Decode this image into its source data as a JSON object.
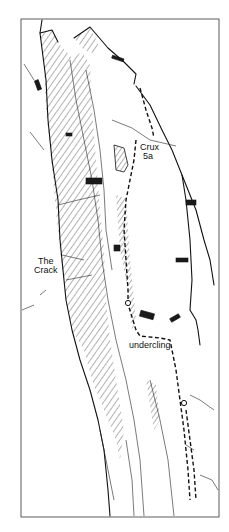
{
  "figure": {
    "type": "climbing-route-topo",
    "colors": {
      "ink": "#111111",
      "paper": "#ffffff"
    },
    "labels": {
      "crux_line1": "Crux",
      "crux_line2": "5a",
      "crack_line1": "The",
      "crack_line2": "Crack",
      "undercling": "undercling"
    },
    "route_features": [
      "dashed-route-line",
      "belay-circle",
      "belay-circle"
    ]
  }
}
